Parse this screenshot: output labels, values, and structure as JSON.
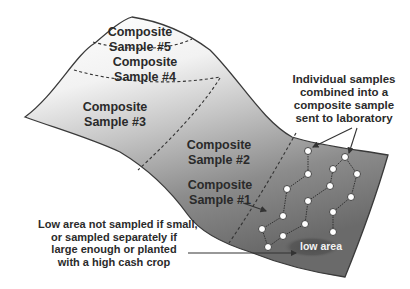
{
  "diagram": {
    "zones": [
      {
        "line1": "Composite",
        "line2": "Sample #5"
      },
      {
        "line1": "Composite",
        "line2": "Sample #4"
      },
      {
        "line1": "Composite",
        "line2": "Sample #3"
      },
      {
        "line1": "Composite",
        "line2": "Sample #2"
      },
      {
        "line1": "Composite",
        "line2": "Sample #1"
      }
    ],
    "callouts": {
      "individual": [
        "Individual samples",
        "combined into a",
        "composite sample",
        "sent to laboratory"
      ],
      "low_area_note": [
        "Low area not sampled if small,",
        "or sampled separately if",
        "large enough or planted",
        "with a high cash crop"
      ]
    },
    "low_area_label": "low area",
    "sample_points_count": 16,
    "colors": {
      "terrain_top": "#ffffff",
      "terrain_bottom": "#6e6e6e",
      "outline": "#3a3a3a",
      "low_area": "#555555",
      "text": "#2a2a2a"
    }
  }
}
